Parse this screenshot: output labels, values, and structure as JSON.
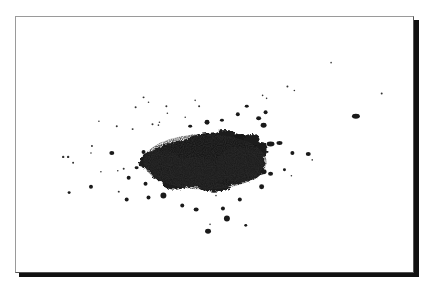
{
  "image": {
    "subject": "Scattered pile of dark granular powder on white background",
    "frame_style": "white photo frame with thin gray top/left border and heavy black drop shadow at bottom/right",
    "colors": {
      "background": "#ffffff",
      "particles": "#1a1a1a",
      "frame_border": "#9a9a9a",
      "shadow": "#111111"
    },
    "main_pile": {
      "center": [
        222,
        160
      ],
      "approx_width": 115,
      "approx_height": 55
    }
  }
}
